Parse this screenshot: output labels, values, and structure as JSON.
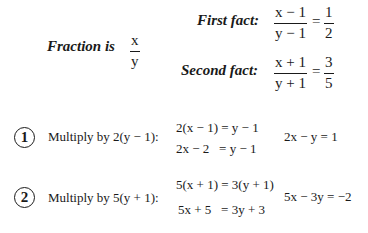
{
  "definition": {
    "label": "Fraction is",
    "numerator": "x",
    "denominator": "y"
  },
  "facts": [
    {
      "label": "First fact:",
      "numerator": "x − 1",
      "denominator": "y − 1",
      "equals": "=",
      "rhs_numerator": "1",
      "rhs_denominator": "2"
    },
    {
      "label": "Second fact:",
      "numerator": "x + 1",
      "denominator": "y + 1",
      "equals": "=",
      "rhs_numerator": "3",
      "rhs_denominator": "5"
    }
  ],
  "steps": [
    {
      "number": "1",
      "instruction": "Multiply by 2(y − 1):",
      "line1": "2(x − 1) = y − 1",
      "line2": "2x − 2   = y − 1",
      "result": "2x − y = 1"
    },
    {
      "number": "2",
      "instruction": "Multiply by 5(y + 1):",
      "line1": "5(x + 1) = 3(y + 1)",
      "line2": "5x + 5   = 3y + 3",
      "result": "5x − 3y = −2"
    }
  ]
}
